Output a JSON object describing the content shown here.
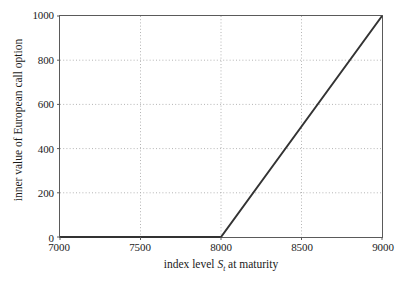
{
  "chart_data": {
    "type": "line",
    "title": "",
    "xlabel": "index level S_t at maturity",
    "xlabel_prefix": "index level ",
    "xlabel_var": "S",
    "xlabel_sub": "t",
    "xlabel_suffix": " at maturity",
    "ylabel": "inner value of European call option",
    "xlim": [
      7000,
      9000
    ],
    "ylim": [
      0,
      1000
    ],
    "xticks": [
      7000,
      7500,
      8000,
      8500,
      9000
    ],
    "yticks": [
      0,
      200,
      400,
      600,
      800,
      1000
    ],
    "xtick_labels": [
      "7000",
      "7500",
      "8000",
      "8500",
      "9000"
    ],
    "ytick_labels": [
      "0",
      "200",
      "400",
      "600",
      "800",
      "1000"
    ],
    "grid": true,
    "grid_style": "dotted",
    "grid_color": "#b4b4b4",
    "legend": null,
    "line_color": "#333333",
    "line_width": 2,
    "frame_color": "#5a5a5a",
    "background": "#ffffff",
    "series": [
      {
        "name": "inner value of European call option",
        "x": [
          7000,
          7250,
          7500,
          7750,
          8000,
          8250,
          8500,
          8750,
          9000
        ],
        "values": [
          0,
          0,
          0,
          0,
          0,
          250,
          500,
          750,
          1000
        ]
      }
    ],
    "annotations": {
      "strike": 8000,
      "kink_point": [
        8000,
        0
      ],
      "end_point": [
        9000,
        1000
      ]
    }
  }
}
